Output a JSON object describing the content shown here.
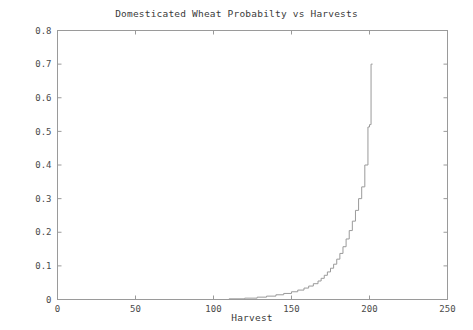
{
  "chart_data": {
    "type": "line",
    "title": "Domesticated Wheat Probabilty vs Harvests",
    "xlabel": "Harvest",
    "ylabel": "Domesticated Wheat Probability",
    "xlim": [
      0,
      250
    ],
    "ylim": [
      0,
      0.8
    ],
    "grid": false,
    "legend": null,
    "line_style": "step",
    "line_color": "#9a9a9a",
    "xticks": [
      0,
      50,
      100,
      150,
      200,
      250
    ],
    "xtick_labels": [
      "0",
      "50",
      "100",
      "150",
      "200",
      "250"
    ],
    "yticks": [
      0,
      0.1,
      0.2,
      0.3,
      0.4,
      0.5,
      0.6,
      0.7,
      0.8
    ],
    "ytick_labels": [
      "0",
      "0.1",
      "0.2",
      "0.3",
      "0.4",
      "0.5",
      "0.6",
      "0.7",
      "0.8"
    ],
    "series": [
      {
        "name": "Domesticated Wheat Probability",
        "x": [
          0,
          20,
          40,
          60,
          80,
          100,
          110,
          120,
          128,
          134,
          140,
          145,
          150,
          154,
          158,
          161,
          164,
          167,
          169,
          171,
          173,
          175,
          177,
          179,
          181,
          183,
          185,
          187,
          189,
          191,
          193,
          195,
          197,
          199,
          200,
          201,
          202
        ],
        "values": [
          0,
          0,
          0,
          0,
          0,
          0,
          0.002,
          0.004,
          0.007,
          0.01,
          0.014,
          0.018,
          0.023,
          0.028,
          0.034,
          0.04,
          0.047,
          0.055,
          0.063,
          0.072,
          0.082,
          0.093,
          0.105,
          0.12,
          0.137,
          0.157,
          0.18,
          0.205,
          0.233,
          0.265,
          0.3,
          0.335,
          0.4,
          0.513,
          0.52,
          0.7,
          0.7
        ]
      }
    ]
  },
  "axes": {
    "frame_color": "#9a9a9a",
    "text_color": "#3a3a3a"
  }
}
